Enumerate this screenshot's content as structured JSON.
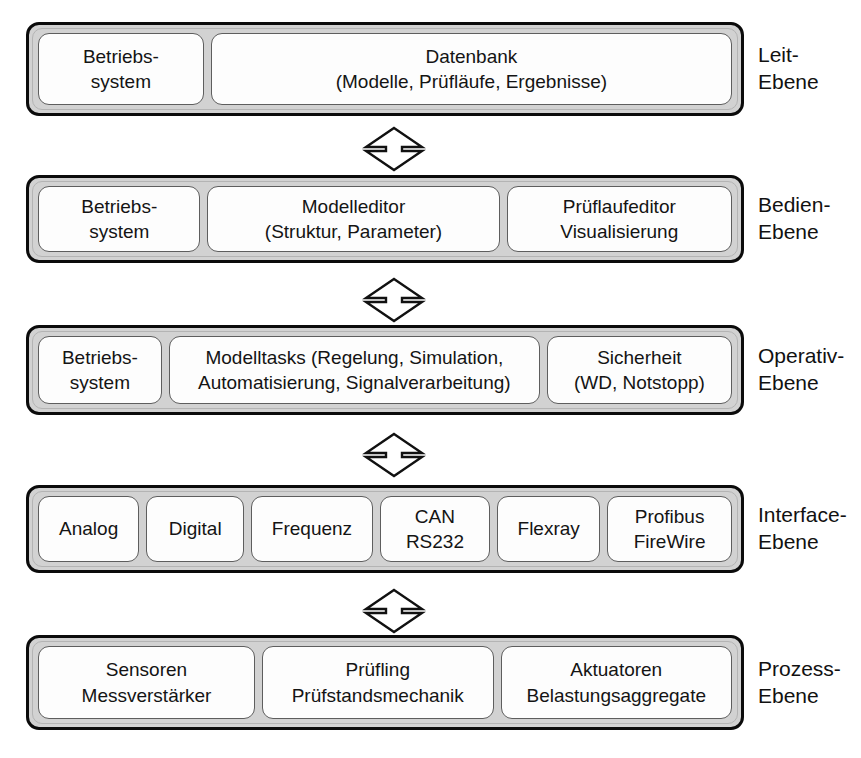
{
  "diagram": {
    "layer_caption_suffix": "Ebene",
    "connector_name": "bidirectional-arrow",
    "colors": {
      "outline": "#0b0b0b",
      "shell_fill": "#d2d2d2",
      "module_fill": "#fdfdfd",
      "module_border": "#5e5e5e",
      "text": "#141414"
    },
    "layers": [
      {
        "id": "leit",
        "caption": "Leit-\nEbene",
        "modules": [
          {
            "id": "betriebssystem",
            "label": "Betriebs-\nsystem",
            "flex": 158
          },
          {
            "id": "datenbank",
            "label": "Datenbank\n(Modelle, Prüfläufe, Ergebnisse)",
            "flex": 528
          }
        ]
      },
      {
        "id": "bedien",
        "caption": "Bedien-\nEbene",
        "modules": [
          {
            "id": "betriebssystem",
            "label": "Betriebs-\nsystem",
            "flex": 158
          },
          {
            "id": "modelleditor",
            "label": "Modelleditor\n(Struktur, Parameter)",
            "flex": 296
          },
          {
            "id": "pruflaufeditor",
            "label": "Prüflaufeditor\nVisualisierung",
            "flex": 225
          }
        ]
      },
      {
        "id": "operativ",
        "caption": "Operativ-\nEbene",
        "modules": [
          {
            "id": "betriebssystem",
            "label": "Betriebs-\nsystem",
            "flex": 120
          },
          {
            "id": "modelltasks",
            "label": "Modelltasks (Regelung, Simulation,\nAutomatisierung, Signalverarbeitung)",
            "flex": 390
          },
          {
            "id": "sicherheit",
            "label": "Sicherheit\n(WD, Notstopp)",
            "flex": 187
          }
        ]
      },
      {
        "id": "interface",
        "caption": "Interface-\nEbene",
        "modules": [
          {
            "id": "analog",
            "label": "Analog",
            "flex": 104
          },
          {
            "id": "digital",
            "label": "Digital",
            "flex": 100
          },
          {
            "id": "frequenz",
            "label": "Frequenz",
            "flex": 128
          },
          {
            "id": "can-rs232",
            "label": "CAN\nRS232",
            "flex": 115
          },
          {
            "id": "flexray",
            "label": "Flexray",
            "flex": 106
          },
          {
            "id": "profibus-firewire",
            "label": "Profibus\nFireWire",
            "flex": 132
          }
        ]
      },
      {
        "id": "prozess",
        "caption": "Prozess-\nEbene",
        "modules": [
          {
            "id": "sensoren",
            "label": "Sensoren\nMessverstärker",
            "flex": 224
          },
          {
            "id": "prufling",
            "label": "Prüfling\nPrüfstandsmechanik",
            "flex": 240
          },
          {
            "id": "aktuatoren",
            "label": "Aktuatoren\nBelastungsaggregate",
            "flex": 240
          }
        ]
      }
    ],
    "connectors": [
      {
        "id": "leit-bedien",
        "from": "leit",
        "to": "bedien"
      },
      {
        "id": "bedien-operativ",
        "from": "bedien",
        "to": "operativ"
      },
      {
        "id": "operativ-interface",
        "from": "operativ",
        "to": "interface"
      },
      {
        "id": "interface-prozess",
        "from": "interface",
        "to": "prozess"
      }
    ]
  }
}
